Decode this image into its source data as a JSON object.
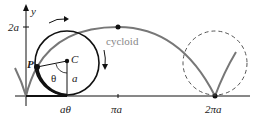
{
  "diagram": {
    "labels": {
      "y_axis": "y",
      "two_a": "2a",
      "P": "P",
      "C": "C",
      "theta": "θ",
      "a": "a",
      "cycloid": "cycloid",
      "a_theta": "aθ",
      "pi_a": "πa",
      "two_pi_a": "2πa"
    },
    "colors": {
      "curve": "#777777",
      "circle": "#111111",
      "dashed_circle": "#555555",
      "axis": "#111111"
    }
  }
}
